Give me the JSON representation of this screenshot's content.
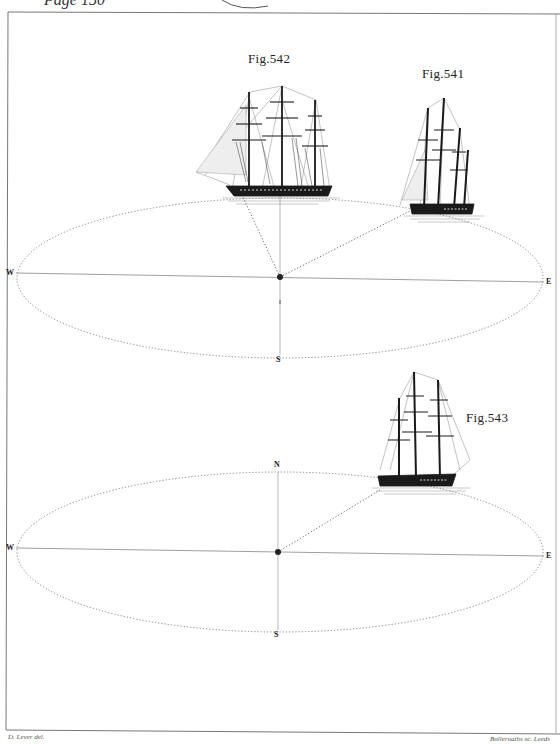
{
  "plate": {
    "page_reference": "Page 150",
    "colors": {
      "ink": "#1a1a1a",
      "paper": "#ffffff",
      "dotted": "#666666"
    }
  },
  "figures": [
    {
      "id": "fig542",
      "label": "Fig.542",
      "description": "three-masted ship under sail, broadside"
    },
    {
      "id": "fig541",
      "label": "Fig.541",
      "description": "three-masted ship, bow view"
    },
    {
      "id": "fig543",
      "label": "Fig.543",
      "description": "three-masted ship, stern quarter view"
    }
  ],
  "diagram_top": {
    "compass": {
      "west": "W",
      "east": "E",
      "south": "S"
    }
  },
  "diagram_bottom": {
    "compass": {
      "north": "N",
      "west": "W",
      "east": "E",
      "south": "S"
    }
  },
  "credits": {
    "left": "D. Lever del.",
    "right": "Bolleruaths sc. Leeds"
  }
}
